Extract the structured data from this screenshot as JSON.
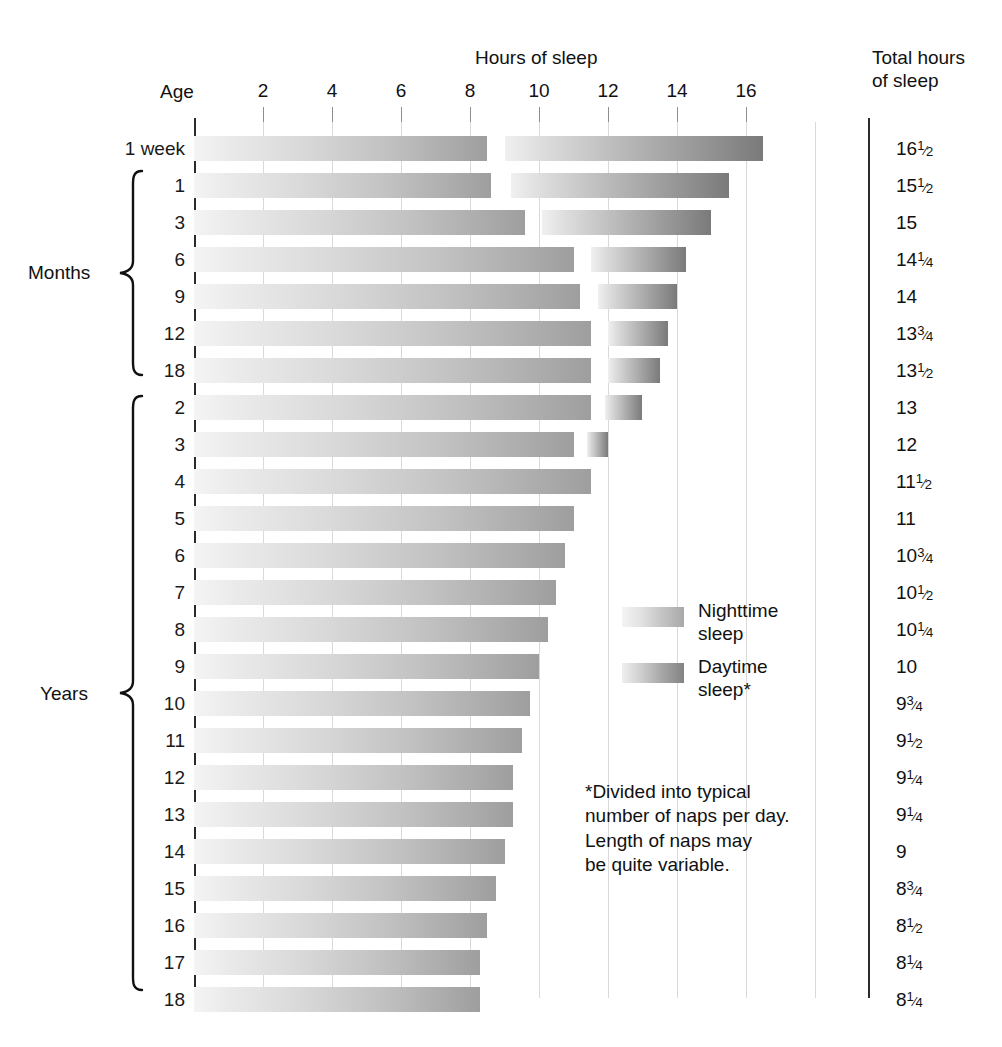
{
  "header": {
    "hours_title": "Hours of sleep",
    "age_title": "Age",
    "total_title": "Total hours\nof sleep"
  },
  "axis": {
    "ticks": [
      2,
      4,
      6,
      8,
      10,
      12,
      14,
      16
    ],
    "min": 0,
    "max": 17.5,
    "unit": "hours"
  },
  "groups": [
    {
      "label": "Months",
      "first_row": 1,
      "last_row": 6
    },
    {
      "label": "Years",
      "first_row": 7,
      "last_row": 23
    }
  ],
  "legend": {
    "items": [
      {
        "name": "nighttime",
        "label": "Nighttime\nsleep"
      },
      {
        "name": "daytime",
        "label": "Daytime\nsleep*"
      }
    ]
  },
  "footnote": "*Divided into typical\nnumber of naps per day.\nLength of naps may\nbe quite variable.",
  "chart_data": {
    "type": "bar",
    "title": "Hours of sleep",
    "xlabel": "Hours of sleep",
    "ylabel": "Age",
    "xlim": [
      0,
      17.5
    ],
    "grid": true,
    "legend_position": "inside-right",
    "stacked": true,
    "categories": [
      "1 week",
      "1",
      "3",
      "6",
      "9",
      "12",
      "18",
      "2",
      "3",
      "4",
      "5",
      "6",
      "7",
      "8",
      "9",
      "10",
      "11",
      "12",
      "13",
      "14",
      "15",
      "16",
      "17",
      "18"
    ],
    "series": [
      {
        "name": "Nighttime sleep",
        "values": [
          8.5,
          8.5,
          9.5,
          11,
          11,
          11.5,
          11.5,
          11.5,
          11,
          11.5,
          11,
          10.75,
          10.5,
          10.25,
          10,
          9.75,
          9.5,
          9.25,
          9.25,
          9,
          8.75,
          8.5,
          8.25,
          8.25
        ]
      },
      {
        "name": "Daytime sleep",
        "values": [
          8,
          7,
          5.5,
          3.25,
          3,
          2.25,
          2,
          1.5,
          1,
          0,
          0,
          0,
          0,
          0,
          0,
          0,
          0,
          0,
          0,
          0,
          0,
          0,
          0,
          0
        ]
      }
    ],
    "rows": [
      {
        "age": "1 week",
        "group": "",
        "night_start": 0,
        "night_end": 8.5,
        "day_start": 9.0,
        "day_end": 16.5,
        "total": "16",
        "total_frac": "1/2"
      },
      {
        "age": "1",
        "group": "Months",
        "night_start": 0,
        "night_end": 8.6,
        "day_start": 9.2,
        "day_end": 15.5,
        "total": "15",
        "total_frac": "1/2"
      },
      {
        "age": "3",
        "group": "Months",
        "night_start": 0,
        "night_end": 9.6,
        "day_start": 10.1,
        "day_end": 15.0,
        "total": "15",
        "total_frac": ""
      },
      {
        "age": "6",
        "group": "Months",
        "night_start": 0,
        "night_end": 11.0,
        "day_start": 11.5,
        "day_end": 14.25,
        "total": "14",
        "total_frac": "1/4"
      },
      {
        "age": "9",
        "group": "Months",
        "night_start": 0,
        "night_end": 11.2,
        "day_start": 11.7,
        "day_end": 14.0,
        "total": "14",
        "total_frac": ""
      },
      {
        "age": "12",
        "group": "Months",
        "night_start": 0,
        "night_end": 11.5,
        "day_start": 12.0,
        "day_end": 13.75,
        "total": "13",
        "total_frac": "3/4"
      },
      {
        "age": "18",
        "group": "Months",
        "night_start": 0,
        "night_end": 11.5,
        "day_start": 12.0,
        "day_end": 13.5,
        "total": "13",
        "total_frac": "1/2"
      },
      {
        "age": "2",
        "group": "Years",
        "night_start": 0,
        "night_end": 11.5,
        "day_start": 11.9,
        "day_end": 13.0,
        "total": "13",
        "total_frac": ""
      },
      {
        "age": "3",
        "group": "Years",
        "night_start": 0,
        "night_end": 11.0,
        "day_start": 11.4,
        "day_end": 12.0,
        "total": "12",
        "total_frac": ""
      },
      {
        "age": "4",
        "group": "Years",
        "night_start": 0,
        "night_end": 11.5,
        "day_start": 0,
        "day_end": 0,
        "total": "11",
        "total_frac": "1/2"
      },
      {
        "age": "5",
        "group": "Years",
        "night_start": 0,
        "night_end": 11.0,
        "day_start": 0,
        "day_end": 0,
        "total": "11",
        "total_frac": ""
      },
      {
        "age": "6",
        "group": "Years",
        "night_start": 0,
        "night_end": 10.75,
        "day_start": 0,
        "day_end": 0,
        "total": "10",
        "total_frac": "3/4"
      },
      {
        "age": "7",
        "group": "Years",
        "night_start": 0,
        "night_end": 10.5,
        "day_start": 0,
        "day_end": 0,
        "total": "10",
        "total_frac": "1/2"
      },
      {
        "age": "8",
        "group": "Years",
        "night_start": 0,
        "night_end": 10.25,
        "day_start": 0,
        "day_end": 0,
        "total": "10",
        "total_frac": "1/4"
      },
      {
        "age": "9",
        "group": "Years",
        "night_start": 0,
        "night_end": 10.0,
        "day_start": 0,
        "day_end": 0,
        "total": "10",
        "total_frac": ""
      },
      {
        "age": "10",
        "group": "Years",
        "night_start": 0,
        "night_end": 9.75,
        "day_start": 0,
        "day_end": 0,
        "total": "9",
        "total_frac": "3/4"
      },
      {
        "age": "11",
        "group": "Years",
        "night_start": 0,
        "night_end": 9.5,
        "day_start": 0,
        "day_end": 0,
        "total": "9",
        "total_frac": "1/2"
      },
      {
        "age": "12",
        "group": "Years",
        "night_start": 0,
        "night_end": 9.25,
        "day_start": 0,
        "day_end": 0,
        "total": "9",
        "total_frac": "1/4"
      },
      {
        "age": "13",
        "group": "Years",
        "night_start": 0,
        "night_end": 9.25,
        "day_start": 0,
        "day_end": 0,
        "total": "9",
        "total_frac": "1/4"
      },
      {
        "age": "14",
        "group": "Years",
        "night_start": 0,
        "night_end": 9.0,
        "day_start": 0,
        "day_end": 0,
        "total": "9",
        "total_frac": ""
      },
      {
        "age": "15",
        "group": "Years",
        "night_start": 0,
        "night_end": 8.75,
        "day_start": 0,
        "day_end": 0,
        "total": "8",
        "total_frac": "3/4"
      },
      {
        "age": "16",
        "group": "Years",
        "night_start": 0,
        "night_end": 8.5,
        "day_start": 0,
        "day_end": 0,
        "total": "8",
        "total_frac": "1/2"
      },
      {
        "age": "17",
        "group": "Years",
        "night_start": 0,
        "night_end": 8.3,
        "day_start": 0,
        "day_end": 0,
        "total": "8",
        "total_frac": "1/4"
      },
      {
        "age": "18",
        "group": "Years",
        "night_start": 0,
        "night_end": 8.3,
        "day_start": 0,
        "day_end": 0,
        "total": "8",
        "total_frac": "1/4"
      }
    ]
  },
  "colors": {
    "night_light": "#f4f4f4",
    "night_dark": "#9e9e9e",
    "day_light": "#f0f0f0",
    "day_dark": "#7a7a7a",
    "axis": "#2b2b2b",
    "grid": "#d9d9d9",
    "text": "#111111"
  }
}
